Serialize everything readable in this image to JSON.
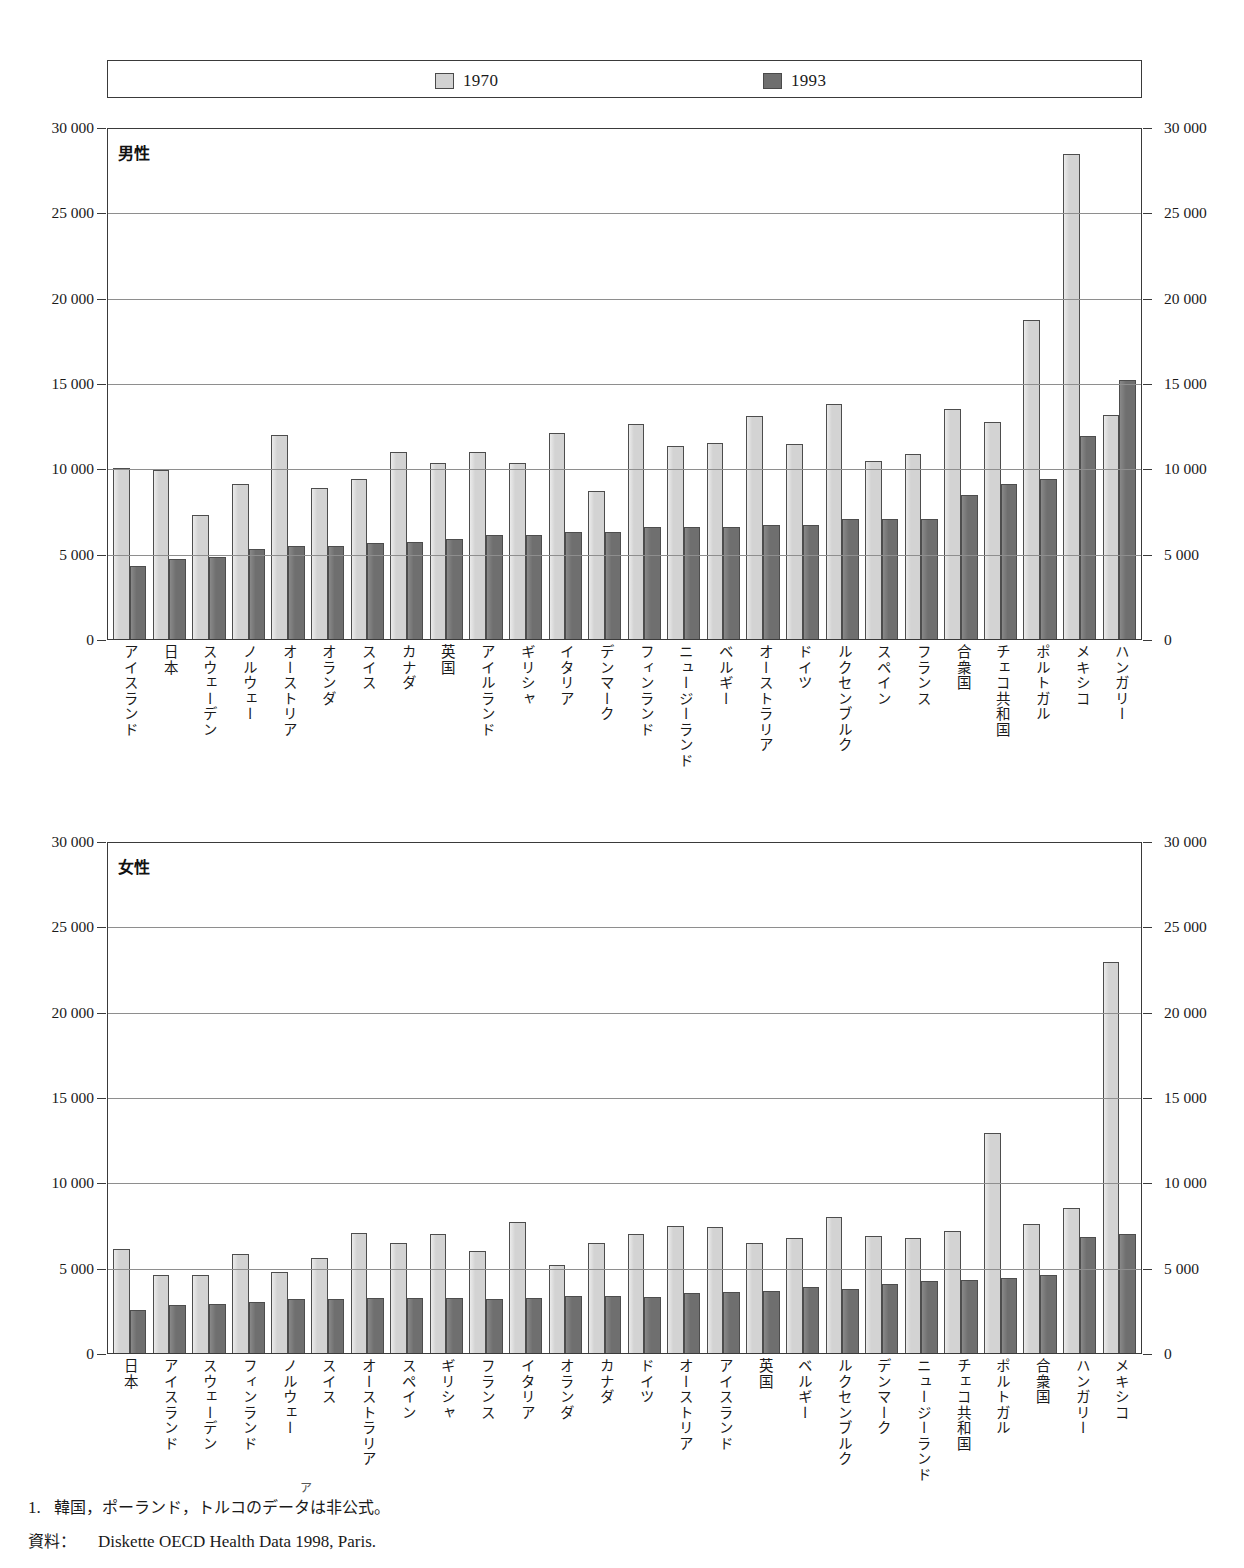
{
  "title": "",
  "legend": {
    "items": [
      {
        "label": "1970",
        "color": "#d3d3d3",
        "name": "legend-1970"
      },
      {
        "label": "1993",
        "color": "#6f6f6f",
        "name": "legend-1993"
      }
    ]
  },
  "axis": {
    "ticks": [
      "30 000",
      "25 000",
      "20 000",
      "15 000",
      "10 000",
      "5 000",
      "0"
    ],
    "values": [
      30000,
      25000,
      20000,
      15000,
      10000,
      5000,
      0
    ],
    "max": 30000,
    "min": 0
  },
  "panels": {
    "male": {
      "caption": "男性"
    },
    "female": {
      "caption": "女性"
    }
  },
  "footnotes": {
    "note_marker": "1.",
    "note_text": "韓国，ポーランド，トルコのデータは非公式。",
    "source_label": "資料：",
    "source_text": "Diskette OECD Health Data 1998, Paris.",
    "superscript": "ア"
  },
  "chart_data": [
    {
      "type": "bar",
      "title": "男性",
      "xlabel": "",
      "ylabel": "",
      "ylim": [
        0,
        30000
      ],
      "yticks": [
        0,
        5000,
        10000,
        15000,
        20000,
        25000,
        30000
      ],
      "grid": true,
      "legend_position": "top",
      "categories": [
        "アイスランド",
        "日本",
        "スウェーデン",
        "ノルウェー",
        "オーストリア",
        "オランダ",
        "スイス",
        "カナダ",
        "英国",
        "アイルランド",
        "ギリシャ",
        "イタリア",
        "デンマーク",
        "フィンランド",
        "ニュージーランド",
        "ベルギー",
        "オーストラリア",
        "ドイツ",
        "ルクセンブルク",
        "スペイン",
        "フランス",
        "合衆国",
        "チェコ共和国",
        "ポルトガル",
        "メキシコ",
        "ハンガリー"
      ],
      "series": [
        {
          "name": "1970",
          "values": [
            10000,
            9900,
            7250,
            9100,
            11950,
            8850,
            9350,
            10950,
            10300,
            10950,
            10300,
            12100,
            8650,
            12600,
            11300,
            11500,
            13050,
            11450,
            13750,
            10450,
            10850,
            13450,
            12700,
            18700,
            28400,
            13150
          ]
        },
        {
          "name": "1993",
          "values": [
            4250,
            4700,
            4800,
            5300,
            5450,
            5450,
            5600,
            5700,
            5850,
            6100,
            6100,
            6250,
            6250,
            6550,
            6550,
            6550,
            6700,
            6700,
            7050,
            7050,
            7050,
            8450,
            9100,
            9400,
            11900,
            15200
          ]
        }
      ]
    },
    {
      "type": "bar",
      "title": "女性",
      "xlabel": "",
      "ylabel": "",
      "ylim": [
        0,
        30000
      ],
      "yticks": [
        0,
        5000,
        10000,
        15000,
        20000,
        25000,
        30000
      ],
      "grid": true,
      "legend_position": "top",
      "categories": [
        "日本",
        "アイスランド",
        "スウェーデン",
        "フィンランド",
        "ノルウェー",
        "スイス",
        "オーストラリア",
        "スペイン",
        "ギリシャ",
        "フランス",
        "イタリア",
        "オランダ",
        "カナダ",
        "ドイツ",
        "オーストリア",
        "アイスランド",
        "英国",
        "ベルギー",
        "ルクセンブルク",
        "デンマーク",
        "ニュージーランド",
        "チェコ共和国",
        "ポルトガル",
        "合衆国",
        "ハンガリー",
        "メキシコ"
      ],
      "series": [
        {
          "name": "1970",
          "values": [
            6100,
            4600,
            4600,
            5800,
            4750,
            5550,
            7050,
            6450,
            6950,
            5950,
            7650,
            5150,
            6450,
            6950,
            7450,
            7400,
            6450,
            6750,
            7950,
            6850,
            6750,
            7150,
            12900,
            7550,
            8500,
            22900
          ]
        },
        {
          "name": "1993",
          "values": [
            2500,
            2800,
            2850,
            3000,
            3150,
            3150,
            3200,
            3200,
            3250,
            3150,
            3250,
            3350,
            3350,
            3300,
            3500,
            3550,
            3650,
            3850,
            3750,
            4050,
            4200,
            4250,
            4400,
            4550,
            6800,
            6950
          ]
        }
      ]
    }
  ]
}
